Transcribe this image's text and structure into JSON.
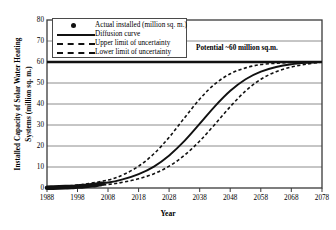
{
  "chart_data": {
    "type": "line",
    "title": "",
    "xlabel": "Year",
    "ylabel_line1": "Installed Capacity of Solar Water Heating",
    "ylabel_line2": "Systems (million sq. m.)",
    "xlim": [
      1988,
      2078
    ],
    "ylim": [
      0,
      80
    ],
    "xticks": [
      1988,
      1998,
      2008,
      2018,
      2028,
      2038,
      2048,
      2058,
      2068,
      2078
    ],
    "yticks": [
      0,
      10,
      20,
      30,
      40,
      50,
      60,
      70,
      80
    ],
    "grid": "horizontal",
    "legend_position": "top-left",
    "annotation": "Potential ~60 million sq.m.",
    "saturation_level": 60,
    "series": [
      {
        "name": "Actual installed (million sq. m.)",
        "style": "marker",
        "x": [
          1988,
          1990,
          1992,
          1994,
          1996,
          1998,
          2000,
          2002,
          2004,
          2005,
          2006
        ],
        "values": [
          0.1,
          0.2,
          0.3,
          0.4,
          0.5,
          0.7,
          0.9,
          1.2,
          1.5,
          1.8,
          2.0
        ]
      },
      {
        "name": "Diffusion curve",
        "style": "solid",
        "x": [
          1988,
          1998,
          2008,
          2013,
          2018,
          2023,
          2028,
          2033,
          2038,
          2043,
          2048,
          2053,
          2058,
          2063,
          2068,
          2073,
          2078
        ],
        "values": [
          0.3,
          1.0,
          2.6,
          4.2,
          6.6,
          10.2,
          15.5,
          22.4,
          30.6,
          39.0,
          46.3,
          51.8,
          55.4,
          57.6,
          58.9,
          59.6,
          60.0
        ]
      },
      {
        "name": "Upper limit of uncertainty",
        "style": "dashed",
        "x": [
          1988,
          1998,
          2008,
          2013,
          2018,
          2023,
          2028,
          2033,
          2038,
          2043,
          2048,
          2053,
          2058,
          2063,
          2068,
          2073,
          2078
        ],
        "values": [
          0.4,
          1.4,
          3.8,
          6.4,
          10.4,
          16.3,
          24.2,
          33.4,
          42.4,
          49.6,
          54.4,
          57.2,
          58.8,
          59.4,
          59.8,
          60.0,
          60.0
        ]
      },
      {
        "name": "Lower limit of uncertainty",
        "style": "dashed",
        "x": [
          1988,
          1998,
          2008,
          2013,
          2018,
          2023,
          2028,
          2033,
          2038,
          2043,
          2048,
          2053,
          2058,
          2063,
          2068,
          2073,
          2078
        ],
        "values": [
          0.2,
          0.6,
          1.7,
          2.8,
          4.4,
          6.8,
          10.4,
          15.6,
          22.4,
          30.4,
          38.8,
          46.2,
          51.8,
          55.4,
          57.6,
          59.0,
          60.0
        ]
      }
    ]
  },
  "axes": {
    "xtick_labels": [
      "1988",
      "1998",
      "2008",
      "2018",
      "2028",
      "2038",
      "2048",
      "2058",
      "2068",
      "2078"
    ],
    "ytick_labels": [
      "0",
      "10",
      "20",
      "30",
      "40",
      "50",
      "60",
      "70",
      "80"
    ],
    "xaxis_title": "Year",
    "yaxis_title_line1": "Installed Capacity of Solar Water Heating",
    "yaxis_title_line2": "Systems (million sq. m.)"
  },
  "legend": {
    "items": [
      {
        "label": "Actual installed (million sq. m.)",
        "key": "marker-dot"
      },
      {
        "label": "Diffusion curve",
        "key": "solid-line"
      },
      {
        "label": "Upper limit of uncertainty",
        "key": "dashed-line"
      },
      {
        "label": "Lower limit of uncertainty",
        "key": "dashed-line"
      }
    ]
  },
  "annotation": {
    "potential_text": "Potential ~60 million sq.m."
  },
  "colors": {
    "line": "#111111",
    "grid": "#8c8c8c",
    "axis": "#3a3a3a",
    "background": "#ffffff"
  }
}
